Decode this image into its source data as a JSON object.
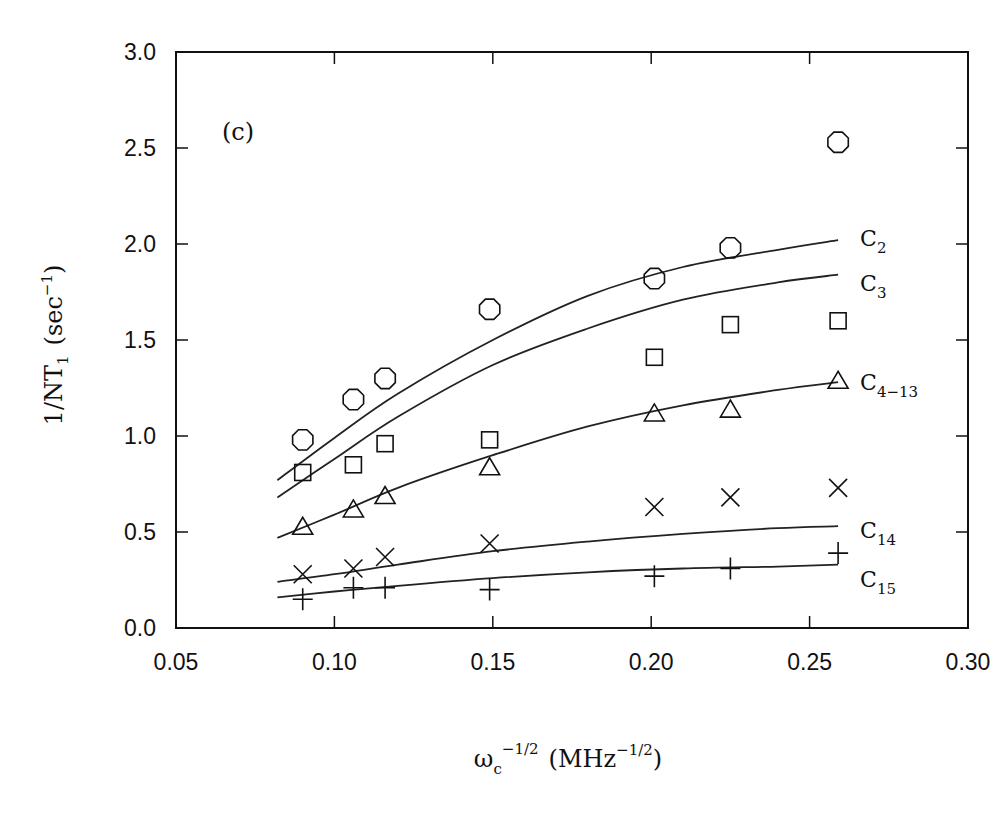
{
  "chart_data": {
    "type": "scatter",
    "title": "",
    "panel_label": "(c)",
    "xlabel": "ωc^(-1/2) (MHz^(-1/2))",
    "xlabel_parts": {
      "base": "ω",
      "base_sub": "c",
      "base_sup": "−1/2",
      "unit_open": "(MHz",
      "unit_sup": "−1/2",
      "unit_close": ")"
    },
    "ylabel": "1/NT1 (sec^-1)",
    "ylabel_parts": {
      "main": "1/NT",
      "sub": "1",
      "unit_open": "(sec",
      "unit_sup": "−1",
      "unit_close": ")"
    },
    "xlim": [
      0.05,
      0.3
    ],
    "ylim": [
      0.0,
      3.0
    ],
    "xticks": [
      "0.05",
      "0.10",
      "0.15",
      "0.20",
      "0.25",
      "0.30"
    ],
    "yticks": [
      "0.0",
      "0.5",
      "1.0",
      "1.5",
      "2.0",
      "2.5",
      "3.0"
    ],
    "grid": false,
    "legend": "curve end labels at right",
    "x": [
      0.09,
      0.106,
      0.116,
      0.149,
      0.201,
      0.225,
      0.259
    ],
    "series": [
      {
        "name": "C2",
        "label_main": "C",
        "label_sub": "2",
        "marker": "octagon",
        "values": [
          0.98,
          1.19,
          1.3,
          1.66,
          1.82,
          1.98,
          2.53
        ],
        "fit": [
          [
            0.082,
            0.77
          ],
          [
            0.1,
            0.99
          ],
          [
            0.12,
            1.22
          ],
          [
            0.15,
            1.5
          ],
          [
            0.18,
            1.73
          ],
          [
            0.21,
            1.88
          ],
          [
            0.24,
            1.97
          ],
          [
            0.259,
            2.02
          ]
        ]
      },
      {
        "name": "C3",
        "label_main": "C",
        "label_sub": "3",
        "marker": "square",
        "values": [
          0.81,
          0.85,
          0.96,
          0.98,
          1.41,
          1.58,
          1.6
        ],
        "fit": [
          [
            0.082,
            0.68
          ],
          [
            0.1,
            0.88
          ],
          [
            0.12,
            1.1
          ],
          [
            0.15,
            1.37
          ],
          [
            0.18,
            1.56
          ],
          [
            0.21,
            1.71
          ],
          [
            0.24,
            1.8
          ],
          [
            0.259,
            1.84
          ]
        ]
      },
      {
        "name": "C4-13",
        "label_main": "C",
        "label_sub": "4−13",
        "marker": "triangle",
        "values": [
          0.53,
          0.62,
          0.69,
          0.84,
          1.12,
          1.14,
          1.29
        ],
        "fit": [
          [
            0.082,
            0.47
          ],
          [
            0.1,
            0.59
          ],
          [
            0.12,
            0.73
          ],
          [
            0.15,
            0.9
          ],
          [
            0.18,
            1.05
          ],
          [
            0.21,
            1.16
          ],
          [
            0.24,
            1.24
          ],
          [
            0.259,
            1.28
          ]
        ]
      },
      {
        "name": "C14",
        "label_main": "C",
        "label_sub": "14",
        "marker": "x",
        "values": [
          0.28,
          0.31,
          0.37,
          0.44,
          0.63,
          0.68,
          0.73
        ],
        "fit": [
          [
            0.082,
            0.24
          ],
          [
            0.1,
            0.28
          ],
          [
            0.12,
            0.33
          ],
          [
            0.15,
            0.4
          ],
          [
            0.18,
            0.45
          ],
          [
            0.21,
            0.49
          ],
          [
            0.24,
            0.52
          ],
          [
            0.259,
            0.53
          ]
        ]
      },
      {
        "name": "C15",
        "label_main": "C",
        "label_sub": "15",
        "marker": "plus",
        "values": [
          0.15,
          0.21,
          0.21,
          0.2,
          0.27,
          0.31,
          0.39
        ],
        "fit": [
          [
            0.082,
            0.16
          ],
          [
            0.1,
            0.19
          ],
          [
            0.12,
            0.22
          ],
          [
            0.15,
            0.26
          ],
          [
            0.18,
            0.29
          ],
          [
            0.21,
            0.31
          ],
          [
            0.24,
            0.32
          ],
          [
            0.259,
            0.33
          ]
        ]
      }
    ]
  }
}
